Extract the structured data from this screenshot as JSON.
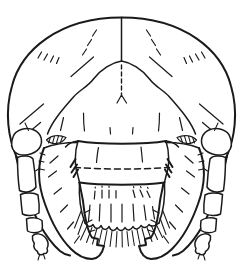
{
  "figure": {
    "kind": "scientific-line-drawing",
    "ink": "#1a1a1a",
    "background": "#ffffff",
    "parts": [
      "head-capsule-outline",
      "epicranial-suture-stem",
      "frontal-sutures",
      "frons-median-dashed-line",
      "clypeus",
      "labrum",
      "mandible-left",
      "mandible-right",
      "antenna-left",
      "antenna-right",
      "antennal-membrane-left",
      "antennal-membrane-right",
      "setae"
    ]
  }
}
